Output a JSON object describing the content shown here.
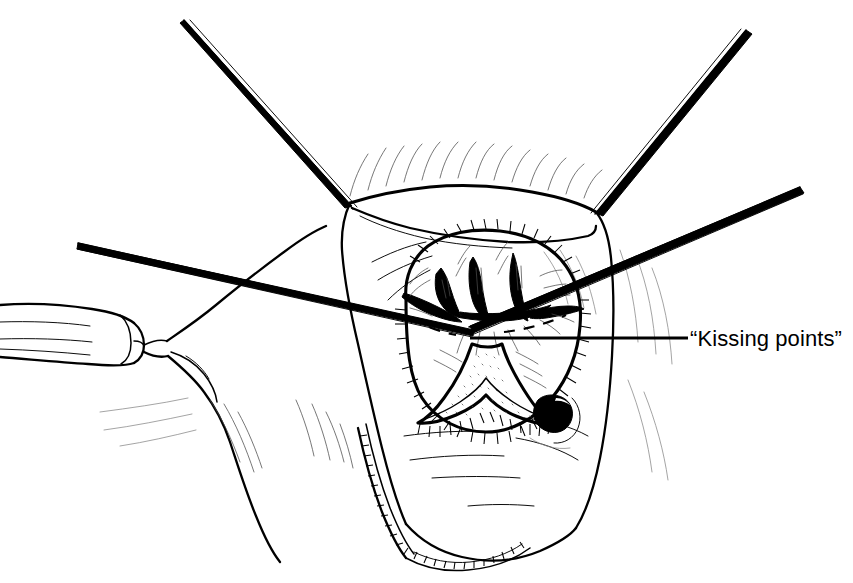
{
  "figure": {
    "kind": "medical-line-illustration",
    "background_color": "#ffffff",
    "ink_color": "#000000",
    "width": 853,
    "height": 583
  },
  "annotations": [
    {
      "id": "kissing-points",
      "text": "“Kissing points”",
      "leader_from_x": 470,
      "leader_to_x": 688,
      "leader_y": 338,
      "label_x": 690,
      "label_y": 326
    }
  ],
  "label": {
    "kissing_points": "“Kissing points”"
  },
  "structures": {
    "retractor_upper_left": "traction suture / retractor from upper left",
    "retractor_upper_right": "traction suture / retractor from upper right",
    "retractor_mid_right": "traction suture / retractor from middle right",
    "probe_across": "long probe crossing the field from left",
    "tube": "cylindrical rolled drape / tube at left",
    "skin_fold": "perineal skin fold",
    "anal_verge": "everted anal verge tissue mass",
    "hemorrhoidal_columns": "three dark hemorrhoidal columns meeting at the kissing points",
    "dentate_line": "dashed dentate line",
    "triangular_lumen": "stippled triangular lumen below the columns",
    "lesion_oval": "solid dark oval lesion at lower right",
    "stippled_margin": "stippled cut margin at lower left"
  }
}
